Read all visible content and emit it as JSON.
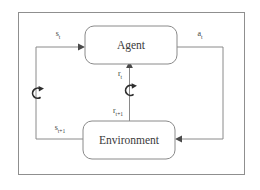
{
  "diagram": {
    "type": "block-flow-diagram",
    "frame": {
      "visible": true,
      "color": "#8f8f8f"
    },
    "line_color": "#8a8a8a",
    "text_color": "#3a3a3a",
    "background": "#ffffff",
    "nodes": [
      {
        "id": "agent",
        "label": "Agent",
        "shape": "rounded-rect"
      },
      {
        "id": "environment",
        "label": "Environment",
        "shape": "rounded-rect"
      }
    ],
    "edges": [
      {
        "id": "state-in",
        "from": "environment",
        "to": "agent",
        "label_base": "s",
        "label_sub": "t",
        "label_full": "s_t",
        "position": "top-left"
      },
      {
        "id": "state-out",
        "from": "environment",
        "to": "agent",
        "label_base": "s",
        "label_sub": "t+1",
        "label_full": "s_t+1",
        "position": "bottom-left"
      },
      {
        "id": "reward-in",
        "from": "environment",
        "to": "agent",
        "label_base": "r",
        "label_sub": "t",
        "label_full": "r_t",
        "position": "center-upper"
      },
      {
        "id": "reward-out",
        "from": "environment",
        "to": "agent",
        "label_base": "r",
        "label_sub": "t+1",
        "label_full": "r_t+1",
        "position": "center-lower"
      },
      {
        "id": "action",
        "from": "agent",
        "to": "environment",
        "label_base": "a",
        "label_sub": "t",
        "label_full": "a_t",
        "position": "top-right"
      }
    ],
    "symbols": [
      {
        "id": "cycle-left",
        "name": "clockwise-cycle-icon",
        "position": "left-path"
      },
      {
        "id": "cycle-center",
        "name": "clockwise-cycle-icon",
        "position": "center-path"
      }
    ]
  }
}
